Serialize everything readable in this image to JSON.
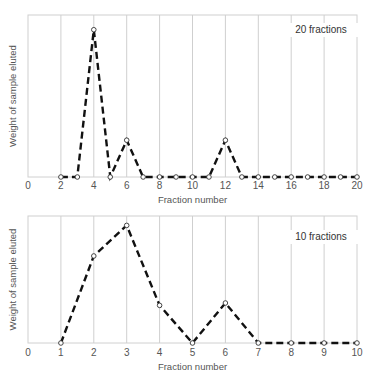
{
  "chart_data": [
    {
      "type": "line",
      "title": "",
      "annotation": "20 fractions",
      "xlabel": "Fraction number",
      "ylabel": "Weight of sample eluted",
      "xlim": [
        0,
        20
      ],
      "ylim": [
        0,
        110
      ],
      "x_ticks": [
        0,
        2,
        4,
        6,
        8,
        10,
        12,
        14,
        16,
        18,
        20
      ],
      "grid": "vertical",
      "line_style": "dashed",
      "marker": "open-circle",
      "x": [
        2,
        3,
        4,
        5,
        6,
        7,
        8,
        9,
        10,
        11,
        12,
        13,
        14,
        15,
        16,
        17,
        18,
        19,
        20
      ],
      "values": [
        0,
        0,
        100,
        0,
        25,
        0,
        0,
        0,
        0,
        0,
        25,
        0,
        0,
        0,
        0,
        0,
        0,
        0,
        0
      ]
    },
    {
      "type": "line",
      "title": "",
      "annotation": "10 fractions",
      "xlabel": "Fraction number",
      "ylabel": "Weight of sample eluted",
      "xlim": [
        0,
        10
      ],
      "ylim": [
        0,
        108
      ],
      "x_ticks": [
        0,
        1,
        2,
        3,
        4,
        5,
        6,
        7,
        8,
        9,
        10
      ],
      "grid": "vertical",
      "line_style": "dashed",
      "marker": "open-circle",
      "x": [
        1,
        2,
        3,
        4,
        5,
        6,
        7,
        8,
        9,
        10
      ],
      "values": [
        0,
        74,
        100,
        32,
        0,
        34,
        0,
        0,
        0,
        0
      ]
    }
  ]
}
